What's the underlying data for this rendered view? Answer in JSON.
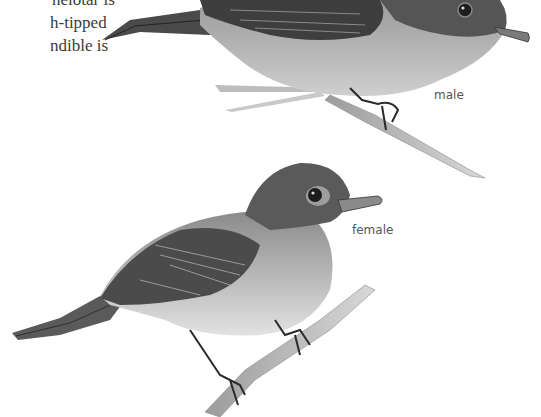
{
  "page": {
    "text_lines": [
      "nelotar is",
      "h-tipped",
      "ndible is"
    ]
  },
  "illustrations": [
    {
      "name": "male-bird",
      "caption": "male"
    },
    {
      "name": "female-bird",
      "caption": "female"
    }
  ],
  "colors": {
    "background": "#ffffff",
    "text": "#3a3a3a",
    "caption": "#555555",
    "bird_dark": "#3b3b3b",
    "bird_mid": "#707070",
    "bird_light": "#c8c8c8"
  }
}
